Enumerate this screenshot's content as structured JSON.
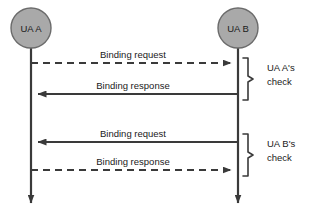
{
  "diagram": {
    "type": "sequence-diagram",
    "colors": {
      "node_fill": "#a9a9a9",
      "node_stroke": "#6b6b6b",
      "line": "#3a3a3a",
      "text": "#1a1a1a",
      "background": "#ffffff"
    },
    "participants": [
      {
        "id": "ua-a",
        "label": "UA A",
        "cx": 31,
        "cy": 28,
        "r": 20
      },
      {
        "id": "ua-b",
        "label": "UA B",
        "cx": 238,
        "cy": 28,
        "r": 20
      }
    ],
    "lifelines": [
      {
        "id": "lifeline-ua-a",
        "x": 31,
        "y1": 48,
        "y2": 207
      },
      {
        "id": "lifeline-ua-b",
        "x": 238,
        "y1": 48,
        "y2": 207
      }
    ],
    "messages": [
      {
        "id": "msg-1",
        "label": "Binding request",
        "from": "ua-a",
        "to": "ua-b",
        "direction": "right",
        "style": "dashed",
        "y": 63,
        "label_x": 133,
        "label_y": 58
      },
      {
        "id": "msg-2",
        "label": "Binding response",
        "from": "ua-b",
        "to": "ua-a",
        "direction": "left",
        "style": "solid",
        "y": 94,
        "label_x": 133,
        "label_y": 89
      },
      {
        "id": "msg-3",
        "label": "Binding request",
        "from": "ua-b",
        "to": "ua-a",
        "direction": "left",
        "style": "solid",
        "y": 142,
        "label_x": 133,
        "label_y": 137
      },
      {
        "id": "msg-4",
        "label": "Binding response",
        "from": "ua-a",
        "to": "ua-b",
        "direction": "right",
        "style": "dashed",
        "y": 170,
        "label_x": 133,
        "label_y": 165
      }
    ],
    "groups": [
      {
        "id": "group-ua-a-check",
        "label_line1": "UA A's",
        "label_line2": "check",
        "brace_x": 246,
        "brace_top": 58,
        "brace_bottom": 100,
        "label_x": 267,
        "label_y1": 71,
        "label_y2": 85
      },
      {
        "id": "group-ua-b-check",
        "label_line1": "UA B's",
        "label_line2": "check",
        "brace_x": 246,
        "brace_top": 134,
        "brace_bottom": 176,
        "label_x": 267,
        "label_y1": 147,
        "label_y2": 161
      }
    ]
  }
}
